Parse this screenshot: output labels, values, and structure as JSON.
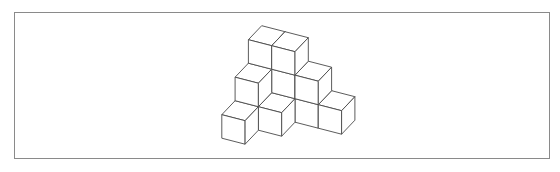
{
  "figure": {
    "type": "isometric-cube-stack",
    "cube_count": 13,
    "stroke_color": "#4a4a4a",
    "face_color": "#ffffff",
    "frame_color": "#8a8a8a",
    "cubes": [
      {
        "x": 0,
        "y": 0,
        "z": 0
      },
      {
        "x": 1,
        "y": 0,
        "z": 0
      },
      {
        "x": 2,
        "y": 0,
        "z": 0
      },
      {
        "x": 3,
        "y": 0,
        "z": 0
      },
      {
        "x": 0,
        "y": 1,
        "z": 0
      },
      {
        "x": 1,
        "y": 1,
        "z": 0
      },
      {
        "x": 0,
        "y": 2,
        "z": 0
      },
      {
        "x": 0,
        "y": 0,
        "z": 1
      },
      {
        "x": 1,
        "y": 0,
        "z": 1
      },
      {
        "x": 2,
        "y": 0,
        "z": 1
      },
      {
        "x": 0,
        "y": 1,
        "z": 1
      },
      {
        "x": 0,
        "y": 0,
        "z": 2
      },
      {
        "x": 1,
        "y": 0,
        "z": 2
      }
    ],
    "projection": {
      "origin": [
        261.7,
        96.2
      ],
      "x_vec": [
        23.3,
        6.0
      ],
      "y_vec": [
        -13.3,
        14.0
      ],
      "z_vec": [
        0,
        -23.5
      ]
    }
  }
}
